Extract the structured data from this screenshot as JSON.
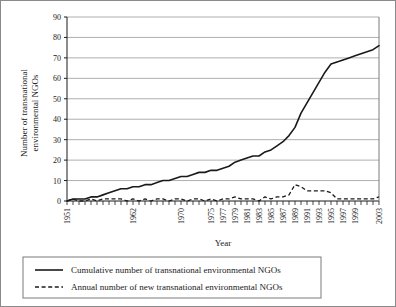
{
  "chart_data": {
    "type": "line",
    "title": "",
    "xlabel": "Year",
    "ylabel": "Number of transnational environmental NGOs",
    "ylabel_line1": "Number of transnational",
    "ylabel_line2": "environmental NGOs",
    "ylim": [
      0,
      90
    ],
    "ytick_values": [
      0,
      10,
      20,
      30,
      40,
      50,
      60,
      70,
      80,
      90
    ],
    "ytick_labels": [
      "0",
      "10",
      "20",
      "30",
      "40",
      "50",
      "60",
      "70",
      "80",
      "90"
    ],
    "grid": true,
    "grid_axis": "y",
    "legend_position": "below",
    "xlim": [
      1951,
      2003
    ],
    "x": [
      1951,
      1952,
      1953,
      1954,
      1955,
      1956,
      1957,
      1958,
      1959,
      1960,
      1961,
      1962,
      1963,
      1964,
      1965,
      1966,
      1967,
      1968,
      1969,
      1970,
      1971,
      1972,
      1973,
      1974,
      1975,
      1976,
      1977,
      1978,
      1979,
      1980,
      1981,
      1982,
      1983,
      1984,
      1985,
      1986,
      1987,
      1988,
      1989,
      1990,
      1991,
      1992,
      1993,
      1994,
      1995,
      1996,
      1997,
      1998,
      1999,
      2000,
      2001,
      2002,
      2003
    ],
    "xtick_labels": [
      "1951",
      "1962",
      "1970",
      "1975",
      "1977",
      "1979",
      "1981",
      "1983",
      "1985",
      "1987",
      "1989",
      "1991",
      "1993",
      "1995",
      "1997",
      "1999",
      "2003"
    ],
    "xtick_values": [
      1951,
      1962,
      1970,
      1975,
      1977,
      1979,
      1981,
      1983,
      1985,
      1987,
      1989,
      1991,
      1993,
      1995,
      1997,
      1999,
      2003
    ],
    "series": [
      {
        "name": "Cumulative number of transnational environmental NGOs",
        "style": "solid",
        "color": "#1a1a1a",
        "values": [
          0,
          1,
          1,
          1,
          2,
          2,
          3,
          4,
          5,
          6,
          6,
          7,
          7,
          8,
          8,
          9,
          10,
          10,
          11,
          12,
          12,
          13,
          14,
          14,
          15,
          15,
          16,
          17,
          19,
          20,
          21,
          22,
          22,
          24,
          25,
          27,
          29,
          32,
          36,
          43,
          48,
          53,
          58,
          63,
          67,
          68,
          69,
          70,
          71,
          72,
          73,
          74,
          76
        ]
      },
      {
        "name": "Annual number of new transnational environmental NGOs",
        "style": "dashed",
        "color": "#1a1a1a",
        "values": [
          0,
          1,
          0,
          0,
          1,
          0,
          1,
          1,
          1,
          1,
          0,
          1,
          0,
          1,
          0,
          1,
          1,
          0,
          1,
          1,
          0,
          1,
          1,
          0,
          1,
          0,
          1,
          1,
          2,
          1,
          1,
          1,
          0,
          2,
          1,
          2,
          2,
          3,
          8,
          7,
          5,
          5,
          5,
          5,
          4,
          1,
          1,
          1,
          1,
          1,
          1,
          1,
          2
        ]
      }
    ],
    "legend": [
      {
        "label": "Cumulative number of transnational environmental NGOs",
        "style": "solid"
      },
      {
        "label": "Annual number of new transnational environmental NGOs",
        "style": "dashed"
      }
    ]
  }
}
